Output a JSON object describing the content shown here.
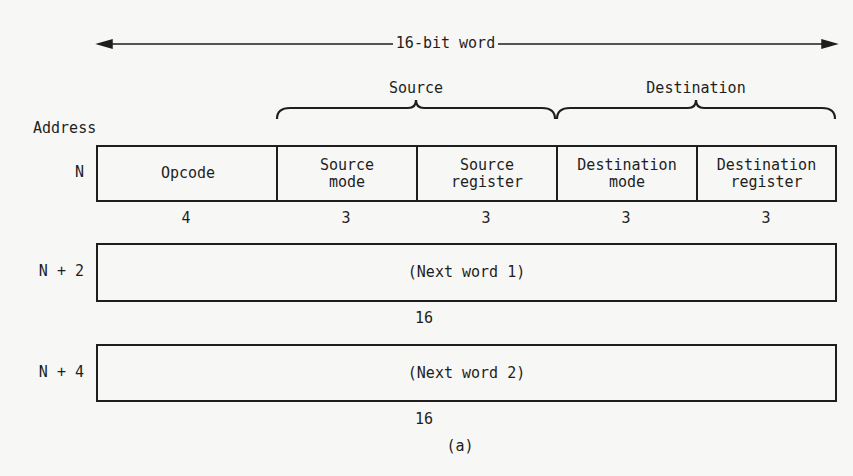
{
  "figure": {
    "word_width_label": "16-bit word",
    "address_header": "Address",
    "caption": "(a)",
    "groups": [
      {
        "label": "Source"
      },
      {
        "label": "Destination"
      }
    ],
    "rows": [
      {
        "address": "N",
        "fields": [
          {
            "line1": "Opcode",
            "line2": "",
            "bits": "4"
          },
          {
            "line1": "Source",
            "line2": "mode",
            "bits": "3"
          },
          {
            "line1": "Source",
            "line2": "register",
            "bits": "3"
          },
          {
            "line1": "Destination",
            "line2": "mode",
            "bits": "3"
          },
          {
            "line1": "Destination",
            "line2": "register",
            "bits": "3"
          }
        ]
      },
      {
        "address": "N + 2",
        "fields": [
          {
            "line1": "(Next word 1)",
            "line2": "",
            "bits": "16"
          }
        ]
      },
      {
        "address": "N + 4",
        "fields": [
          {
            "line1": "(Next word 2)",
            "line2": "",
            "bits": "16"
          }
        ]
      }
    ]
  }
}
